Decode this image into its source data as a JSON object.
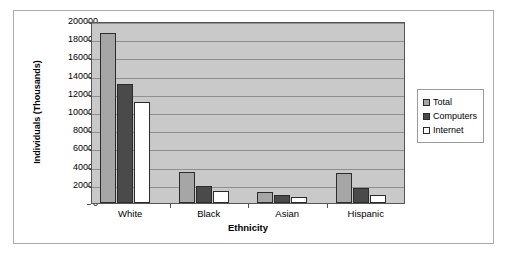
{
  "chart_data": {
    "type": "bar",
    "title": "",
    "xlabel": "Ethnicity",
    "ylabel": "Individuals (Thousands)",
    "categories": [
      "White",
      "Black",
      "Asian",
      "Hispanic"
    ],
    "series": [
      {
        "name": "Total",
        "color": "#a6a6a6",
        "values": [
          187000,
          34000,
          12000,
          33000
        ]
      },
      {
        "name": "Computers",
        "color": "#4a4a4a",
        "values": [
          131000,
          19000,
          8500,
          16000
        ]
      },
      {
        "name": "Internet",
        "color": "#ffffff",
        "values": [
          111000,
          13000,
          7000,
          9000
        ]
      }
    ],
    "ylim": [
      0,
      200000
    ],
    "ytick_step": 20000,
    "yticks": [
      "0",
      "20000",
      "40000",
      "60000",
      "80000",
      "100000",
      "120000",
      "140000",
      "160000",
      "180000",
      "200000"
    ],
    "grid": true,
    "legend_position": "right",
    "plot_background": "#c9c9c9",
    "gridline_color": "#8f8f8f"
  },
  "legend": {
    "entries": [
      "Total",
      "Computers",
      "Internet"
    ]
  }
}
